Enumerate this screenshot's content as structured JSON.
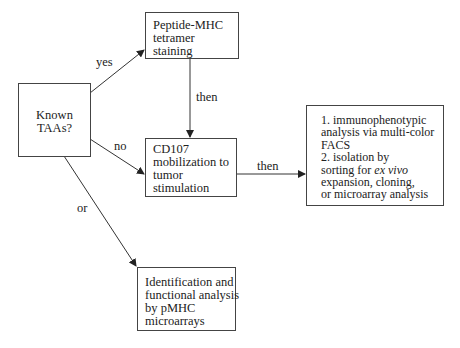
{
  "diagram": {
    "nodes": {
      "known_taas": {
        "lines": [
          "Known",
          "TAAs?"
        ]
      },
      "tetramer": {
        "lines": [
          "Peptide-MHC",
          "tetramer",
          "staining"
        ]
      },
      "cd107": {
        "lines": [
          "CD107",
          "mobilization to",
          "tumor",
          "stimulation"
        ]
      },
      "analysis": {
        "lines": [
          "1. immunophenotypic",
          "analysis via multi-color",
          "FACS",
          "2.  isolation by",
          "sorting for ",
          "expansion, cloning,",
          "or microarray analysis"
        ],
        "italic_fragment": "ex vivo"
      },
      "pmhc": {
        "lines": [
          "Identification and",
          "functional analysis",
          "by pMHC",
          "microarrays"
        ]
      }
    },
    "edge_labels": {
      "yes": "yes",
      "then_down": "then",
      "no": "no",
      "then_right": "then",
      "or": "or"
    },
    "edges": [
      {
        "from": "known_taas",
        "to": "tetramer",
        "label": "yes"
      },
      {
        "from": "tetramer",
        "to": "cd107",
        "label": "then"
      },
      {
        "from": "known_taas",
        "to": "cd107",
        "label": "no"
      },
      {
        "from": "cd107",
        "to": "analysis",
        "label": "then"
      },
      {
        "from": "known_taas",
        "to": "pmhc",
        "label": "or"
      }
    ]
  }
}
